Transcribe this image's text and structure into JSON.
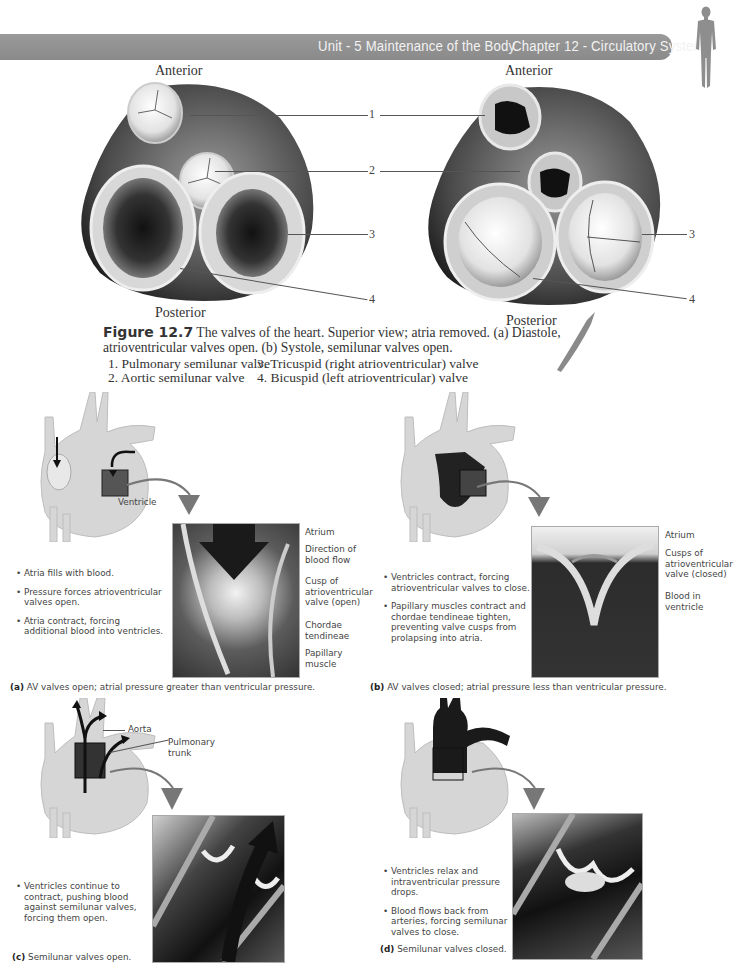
{
  "header": {
    "unit": "Unit - 5 Maintenance of the Body",
    "chapter": "Chapter 12 - Circulatory System",
    "bar_color": "#919191",
    "icon": "human-silhouette-icon"
  },
  "figure_top": {
    "left_view": {
      "anterior": "Anterior",
      "posterior": "Posterior",
      "state": "diastole"
    },
    "right_view": {
      "anterior": "Anterior",
      "posterior": "Posterior",
      "state": "systole"
    },
    "callouts": [
      "1",
      "2",
      "3",
      "4",
      "3",
      "4"
    ],
    "caption": {
      "label": "Figure 12.7",
      "text_line1": " The valves of the heart. Superior view; atria removed. (a) Diastole,",
      "text_line2": "atrioventricular valves open. (b) Systole, semilunar valves open."
    },
    "legend": [
      "1. Pulmonary semilunar valve",
      "2. Aortic semilunar valve",
      "3. Tricuspid (right atrioventricular) valve",
      "4. Bicuspid (left atrioventricular) valve"
    ]
  },
  "panels": {
    "a": {
      "heart_label": "Ventricle",
      "bullets": [
        "Atria fills with blood.",
        "Pressure forces atrioventricular valves open.",
        "Atria contract, forcing additional blood into ventricles."
      ],
      "inset_labels": [
        "Atrium",
        "Direction of blood flow",
        "Cusp of atrioventricular valve (open)",
        "Chordae tendineae",
        "Papillary muscle"
      ],
      "caption_letter": "(a)",
      "caption": " AV valves open; atrial pressure greater than ventricular pressure."
    },
    "b": {
      "bullets": [
        "Ventricles contract, forcing atrioventricular valves to close.",
        "Papillary muscles contract and chordae tendineae tighten, preventing valve cusps from prolapsing into atria."
      ],
      "inset_labels": [
        "Atrium",
        "Cusps of atrioventricular valve (closed)",
        "Blood in ventricle"
      ],
      "caption_letter": "(b)",
      "caption": " AV valves closed; atrial pressure less than ventricular pressure."
    },
    "c": {
      "heart_labels": [
        "Aorta",
        "Pulmonary trunk"
      ],
      "bullets": [
        "Ventricles continue to contract, pushing blood against semilunar valves, forcing them open."
      ],
      "caption_letter": "(c)",
      "caption": " Semilunar valves open."
    },
    "d": {
      "bullets": [
        "Ventricles relax and intraventricular pressure drops.",
        "Blood flows back from arteries, forcing semilunar valves to close."
      ],
      "caption_letter": "(d)",
      "caption": " Semilunar valves closed."
    }
  }
}
